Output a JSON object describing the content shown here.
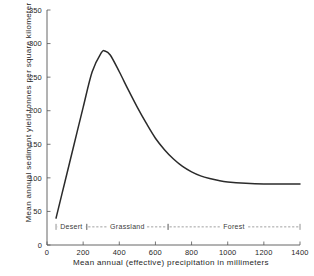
{
  "chart_data": {
    "type": "line",
    "title": "",
    "xlabel": "Mean annual (effective) precipitation in  millimeters",
    "ylabel": "Mean annual sediment yield tonnes per square kilometer",
    "xlim": [
      0,
      1400
    ],
    "ylim": [
      0,
      350
    ],
    "grid": false,
    "legend": null,
    "xticks": [
      0,
      200,
      400,
      600,
      800,
      1000,
      1200,
      1400
    ],
    "yticks": [
      0,
      50,
      100,
      150,
      200,
      250,
      300,
      350
    ],
    "series": [
      {
        "name": "Sediment yield",
        "x": [
          50,
          100,
          150,
          200,
          250,
          300,
          320,
          350,
          400,
          450,
          500,
          550,
          600,
          650,
          700,
          750,
          800,
          850,
          900,
          950,
          1000,
          1100,
          1200,
          1300,
          1400
        ],
        "values": [
          40,
          95,
          150,
          205,
          258,
          286,
          289,
          283,
          258,
          231,
          205,
          181,
          159,
          142,
          128,
          117,
          109,
          103,
          99,
          96,
          94,
          92,
          91,
          91,
          91
        ]
      }
    ],
    "annotations": [
      {
        "label": "Desert",
        "x_start": 50,
        "x_end": 220,
        "y": 27
      },
      {
        "label": "Grassland",
        "x_start": 220,
        "x_end": 670,
        "y": 27
      },
      {
        "label": "Forest",
        "x_start": 670,
        "x_end": 1400,
        "y": 27
      }
    ]
  }
}
